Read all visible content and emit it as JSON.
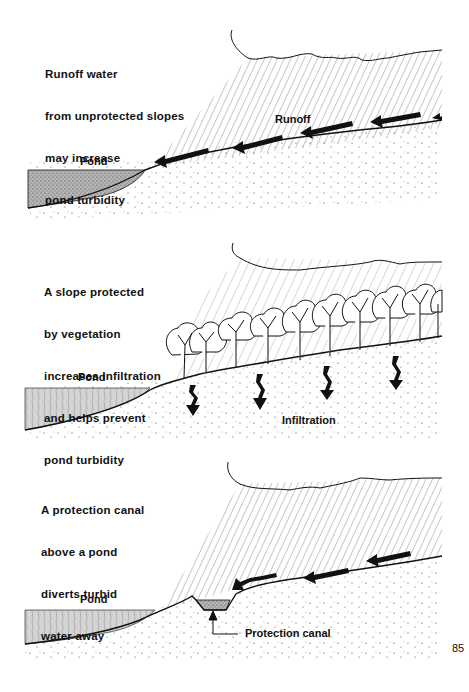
{
  "page": {
    "number": "85"
  },
  "panels": [
    {
      "id": "runoff",
      "caption": [
        "Runoff water",
        "from unprotected slopes",
        "may increase",
        "pond turbidity"
      ],
      "labels": {
        "pond": "Pond",
        "flow": "Runoff"
      },
      "arrow_type": "runoff-arrow",
      "arrow_count": 5
    },
    {
      "id": "vegetation",
      "caption": [
        "A slope protected",
        "by vegetation",
        "increases infiltration",
        "and helps prevent",
        "pond turbidity"
      ],
      "labels": {
        "pond": "Pond",
        "flow": "Infiltration"
      },
      "arrow_type": "infiltration-arrow",
      "arrow_count": 4,
      "tree_count": 11
    },
    {
      "id": "canal",
      "caption": [
        "A protection canal",
        "above a pond",
        "diverts turbid",
        "water away"
      ],
      "labels": {
        "pond": "Pond",
        "canal": "Protection canal"
      },
      "arrow_type": "runoff-arrow",
      "arrow_count": 4
    }
  ],
  "colors": {
    "ink": "#111111",
    "pond_fill": "#cfcfcf",
    "pond_fill_dark": "#a8a8a8",
    "background": "#ffffff"
  }
}
